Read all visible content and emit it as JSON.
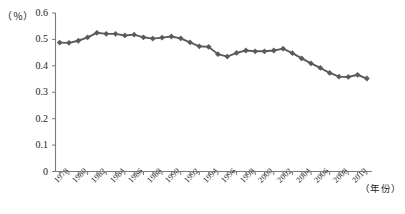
{
  "chart_data": {
    "type": "line",
    "title": "",
    "xlabel": "（年份）",
    "ylabel": "（％）",
    "ylim": [
      0,
      0.6
    ],
    "xlim": [
      1978,
      2011
    ],
    "grid": false,
    "legend": null,
    "y_ticks": [
      "0",
      "0.1",
      "0.2",
      "0.3",
      "0.4",
      "0.5",
      "0.6"
    ],
    "y_tick_values": [
      0,
      0.1,
      0.2,
      0.3,
      0.4,
      0.5,
      0.6
    ],
    "x_tick_labels": [
      "1978",
      "1980",
      "1982",
      "1984",
      "1986",
      "1988",
      "1990",
      "1992",
      "1994",
      "1996",
      "1998",
      "2000",
      "2002",
      "2004",
      "2006",
      "2008",
      "2010"
    ],
    "x": [
      1978,
      1979,
      1980,
      1981,
      1982,
      1983,
      1984,
      1985,
      1986,
      1987,
      1988,
      1989,
      1990,
      1991,
      1992,
      1993,
      1994,
      1995,
      1996,
      1997,
      1998,
      1999,
      2000,
      2001,
      2002,
      2003,
      2004,
      2005,
      2006,
      2007,
      2008,
      2009,
      2010,
      2011
    ],
    "values": [
      0.488,
      0.487,
      0.495,
      0.508,
      0.525,
      0.521,
      0.521,
      0.515,
      0.518,
      0.508,
      0.503,
      0.507,
      0.511,
      0.504,
      0.489,
      0.474,
      0.472,
      0.444,
      0.435,
      0.449,
      0.458,
      0.455,
      0.455,
      0.458,
      0.465,
      0.448,
      0.428,
      0.409,
      0.392,
      0.373,
      0.359,
      0.358,
      0.366,
      0.352
    ],
    "marker": "diamond",
    "series_color": "#5a5a5a",
    "axis_color": "#7a7a7a"
  },
  "axis": {
    "y_unit": "（％）",
    "x_unit": "（年份）"
  }
}
